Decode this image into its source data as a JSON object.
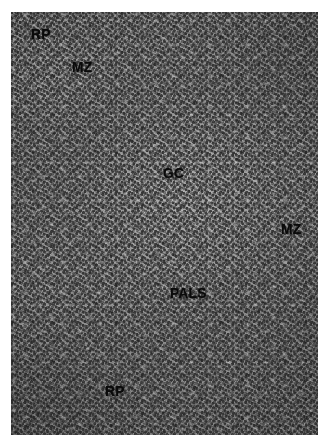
{
  "figure": {
    "kind": "light-microscopy-histology-micrograph",
    "stain_appearance": "grayscale",
    "background_color": "#ffffff",
    "plate_tone": "#8e8e8e",
    "label_color": "#0a0a0a"
  },
  "annotations": [
    {
      "id": "rp-top",
      "text": "RP",
      "meaning": "red pulp",
      "x": 31,
      "y": 26
    },
    {
      "id": "mz-top",
      "text": "MZ",
      "meaning": "marginal zone",
      "x": 72,
      "y": 59
    },
    {
      "id": "gc",
      "text": "GC",
      "meaning": "germinal center",
      "x": 163,
      "y": 165
    },
    {
      "id": "mz-right",
      "text": "MZ",
      "meaning": "marginal zone",
      "x": 281,
      "y": 221
    },
    {
      "id": "pals",
      "text": "PALS",
      "meaning": "periarteriolar lymphoid sheath",
      "x": 170,
      "y": 285
    },
    {
      "id": "rp-bottom",
      "text": "RP",
      "meaning": "red pulp",
      "x": 105,
      "y": 383
    }
  ]
}
